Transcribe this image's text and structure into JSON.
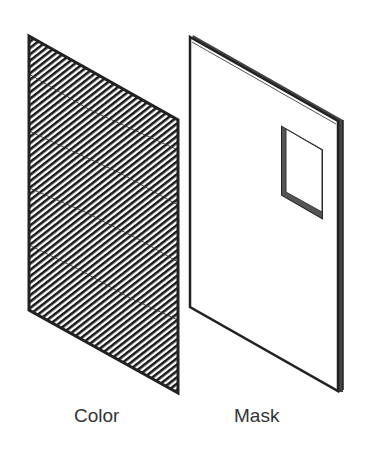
{
  "figure": {
    "panels": [
      {
        "id": "color",
        "label": "Color",
        "fill": "diagonal-hatch",
        "stroke": "#222222"
      },
      {
        "id": "mask",
        "label": "Mask",
        "fill": "#ffffff",
        "stroke": "#222222",
        "has_window": true
      }
    ]
  }
}
